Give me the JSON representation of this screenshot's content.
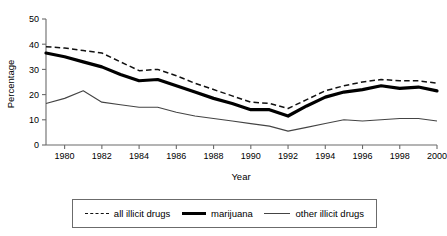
{
  "chart_data": {
    "type": "line",
    "title": "",
    "xlabel": "Year",
    "ylabel": "Percentage",
    "xlim": [
      1979,
      2000
    ],
    "ylim": [
      0,
      50
    ],
    "grid": false,
    "legend_position": "bottom",
    "x": [
      1979,
      1980,
      1981,
      1982,
      1983,
      1984,
      1985,
      1986,
      1987,
      1988,
      1989,
      1990,
      1991,
      1992,
      1993,
      1994,
      1995,
      1996,
      1997,
      1998,
      1999,
      2000
    ],
    "xticks": [
      1980,
      1982,
      1984,
      1986,
      1988,
      1990,
      1992,
      1994,
      1996,
      1998,
      2000
    ],
    "yticks": [
      0,
      10,
      20,
      30,
      40,
      50
    ],
    "series": [
      {
        "name": "all illicit drugs",
        "style": "dashed",
        "values": [
          39.0,
          38.5,
          37.5,
          36.5,
          33.0,
          29.5,
          30.0,
          27.5,
          24.5,
          22.0,
          19.5,
          17.0,
          16.5,
          14.5,
          18.0,
          21.5,
          23.5,
          25.0,
          26.0,
          25.5,
          25.5,
          24.5
        ]
      },
      {
        "name": "marijuana",
        "style": "thick-solid",
        "values": [
          36.5,
          35.0,
          33.0,
          31.0,
          28.0,
          25.5,
          26.0,
          23.5,
          21.0,
          18.5,
          16.5,
          14.0,
          14.0,
          11.5,
          15.5,
          19.0,
          21.0,
          22.0,
          23.5,
          22.5,
          23.0,
          21.5
        ]
      },
      {
        "name": "other illicit drugs",
        "style": "thin-solid",
        "values": [
          16.5,
          18.5,
          21.5,
          17.0,
          16.0,
          15.0,
          15.0,
          13.0,
          11.5,
          10.5,
          9.5,
          8.5,
          7.5,
          5.5,
          7.0,
          8.5,
          10.0,
          9.5,
          10.0,
          10.5,
          10.5,
          9.5
        ]
      }
    ]
  },
  "legend": {
    "items": [
      {
        "label": "all illicit drugs",
        "swatch": "dashed-line-icon"
      },
      {
        "label": "marijuana",
        "swatch": "thick-line-icon"
      },
      {
        "label": "other illicit drugs",
        "swatch": "thin-line-icon"
      }
    ]
  },
  "colors": {
    "series_all": "#111111",
    "series_marijuana": "#000000",
    "series_other": "#444444",
    "axis": "#6b6b6b",
    "background": "#ffffff"
  }
}
